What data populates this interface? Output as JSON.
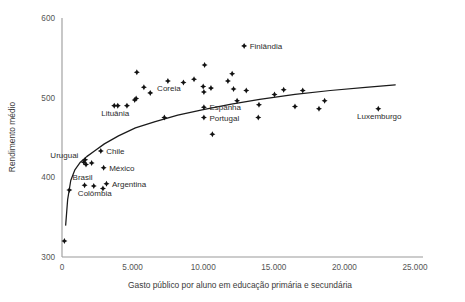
{
  "chart_data": {
    "type": "scatter",
    "title": "",
    "xlabel": "Gasto público por aluno em educação primária e secundária",
    "ylabel": "Rendimento médio",
    "xlim": [
      0,
      25000
    ],
    "ylim": [
      300,
      600
    ],
    "grid": false,
    "legend": null,
    "xticks": [
      {
        "value": 0,
        "label": "0"
      },
      {
        "value": 5000,
        "label": "5.000"
      },
      {
        "value": 10000,
        "label": "10.000"
      },
      {
        "value": 15000,
        "label": "15.000"
      },
      {
        "value": 20000,
        "label": "20.000"
      },
      {
        "value": 25000,
        "label": "25.000"
      }
    ],
    "yticks": [
      {
        "value": 300,
        "label": "300"
      },
      {
        "value": 400,
        "label": "400"
      },
      {
        "value": 500,
        "label": "500"
      },
      {
        "value": 600,
        "label": "600"
      }
    ],
    "points": [
      {
        "x": 170,
        "y": 320,
        "label": ""
      },
      {
        "x": 520,
        "y": 384,
        "label": ""
      },
      {
        "x": 1550,
        "y": 419,
        "label": "Uruguai",
        "label_pos": "left"
      },
      {
        "x": 1700,
        "y": 416,
        "label": ""
      },
      {
        "x": 1640,
        "y": 422,
        "label": ""
      },
      {
        "x": 2100,
        "y": 418,
        "label": ""
      },
      {
        "x": 2750,
        "y": 433,
        "label": "Chile",
        "label_pos": "right"
      },
      {
        "x": 1600,
        "y": 390,
        "label": "Brasil",
        "label_pos": "above"
      },
      {
        "x": 2250,
        "y": 389,
        "label": "Colômbia",
        "label_pos": "below"
      },
      {
        "x": 2900,
        "y": 386,
        "label": ""
      },
      {
        "x": 3150,
        "y": 392,
        "label": "Argentina",
        "label_pos": "right"
      },
      {
        "x": 2950,
        "y": 412,
        "label": "México",
        "label_pos": "right"
      },
      {
        "x": 3700,
        "y": 490,
        "label": "Lituânia",
        "label_pos": "below"
      },
      {
        "x": 3950,
        "y": 490,
        "label": ""
      },
      {
        "x": 4600,
        "y": 490,
        "label": ""
      },
      {
        "x": 5150,
        "y": 497,
        "label": ""
      },
      {
        "x": 5250,
        "y": 499,
        "label": ""
      },
      {
        "x": 5300,
        "y": 532,
        "label": ""
      },
      {
        "x": 5800,
        "y": 513,
        "label": ""
      },
      {
        "x": 6250,
        "y": 506,
        "label": ""
      },
      {
        "x": 7250,
        "y": 475,
        "label": ""
      },
      {
        "x": 7500,
        "y": 521,
        "label": "Coreia",
        "label_pos": "below"
      },
      {
        "x": 8600,
        "y": 519,
        "label": ""
      },
      {
        "x": 9350,
        "y": 523,
        "label": ""
      },
      {
        "x": 10100,
        "y": 541,
        "label": ""
      },
      {
        "x": 10000,
        "y": 514,
        "label": ""
      },
      {
        "x": 10050,
        "y": 507,
        "label": ""
      },
      {
        "x": 10550,
        "y": 512,
        "label": ""
      },
      {
        "x": 10050,
        "y": 488,
        "label": "Espanha",
        "label_pos": "right"
      },
      {
        "x": 10050,
        "y": 475,
        "label": "Portugal",
        "label_pos": "right"
      },
      {
        "x": 10650,
        "y": 454,
        "label": ""
      },
      {
        "x": 11750,
        "y": 521,
        "label": ""
      },
      {
        "x": 12050,
        "y": 530,
        "label": ""
      },
      {
        "x": 12150,
        "y": 511,
        "label": ""
      },
      {
        "x": 12400,
        "y": 496,
        "label": ""
      },
      {
        "x": 13050,
        "y": 509,
        "label": ""
      },
      {
        "x": 12900,
        "y": 565,
        "label": "Finlândia",
        "label_pos": "right"
      },
      {
        "x": 13950,
        "y": 491,
        "label": ""
      },
      {
        "x": 13900,
        "y": 475,
        "label": ""
      },
      {
        "x": 15050,
        "y": 504,
        "label": ""
      },
      {
        "x": 15700,
        "y": 510,
        "label": ""
      },
      {
        "x": 16500,
        "y": 489,
        "label": ""
      },
      {
        "x": 17050,
        "y": 509,
        "label": ""
      },
      {
        "x": 18200,
        "y": 486,
        "label": ""
      },
      {
        "x": 18600,
        "y": 496,
        "label": ""
      },
      {
        "x": 22400,
        "y": 486,
        "label": "Luxemburgo",
        "label_pos": "below"
      }
    ],
    "trendline": {
      "description": "logarithmic fit curve",
      "points": [
        {
          "x": 260,
          "y": 340
        },
        {
          "x": 400,
          "y": 372
        },
        {
          "x": 620,
          "y": 396
        },
        {
          "x": 900,
          "y": 409
        },
        {
          "x": 1300,
          "y": 419
        },
        {
          "x": 1750,
          "y": 426
        },
        {
          "x": 2300,
          "y": 433
        },
        {
          "x": 3000,
          "y": 442
        },
        {
          "x": 4000,
          "y": 452
        },
        {
          "x": 5200,
          "y": 462
        },
        {
          "x": 6600,
          "y": 470
        },
        {
          "x": 8200,
          "y": 478
        },
        {
          "x": 10000,
          "y": 485
        },
        {
          "x": 12000,
          "y": 492
        },
        {
          "x": 14000,
          "y": 498
        },
        {
          "x": 16500,
          "y": 504
        },
        {
          "x": 19000,
          "y": 509
        },
        {
          "x": 21500,
          "y": 513
        },
        {
          "x": 23600,
          "y": 516
        }
      ]
    }
  }
}
